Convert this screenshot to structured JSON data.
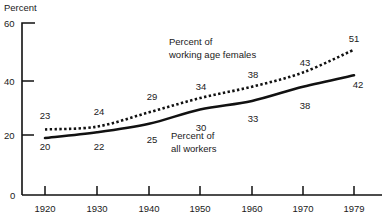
{
  "chart_data": {
    "type": "line",
    "title": "",
    "xlabel": "",
    "ylabel": "Percent",
    "ylim": [
      0,
      60
    ],
    "yticks": [
      0,
      20,
      40,
      60
    ],
    "grid": false,
    "legend_position": "inline-annotation",
    "categories": [
      "1920",
      "1930",
      "1940",
      "1950",
      "1960",
      "1970",
      "1979"
    ],
    "x": [
      1920,
      1930,
      1940,
      1950,
      1960,
      1970,
      1979
    ],
    "series": [
      {
        "name": "Percent of working age females",
        "style": "dotted",
        "values": [
          23,
          24,
          29,
          34,
          38,
          43,
          51
        ]
      },
      {
        "name": "Percent of all workers",
        "style": "solid",
        "values": [
          20,
          22,
          25,
          30,
          33,
          38,
          42
        ]
      }
    ]
  },
  "axis": {
    "y_unit_label": "Percent",
    "y_ticks": [
      "60",
      "40",
      "20",
      "0"
    ],
    "x_ticks": [
      "1920",
      "1930",
      "1940",
      "1950",
      "1960",
      "1970",
      "1979"
    ]
  },
  "annotations": {
    "females_line1": "Percent of",
    "females_line2": "working age females",
    "workers_line1": "Percent of",
    "workers_line2": "all workers"
  },
  "point_labels": {
    "females": [
      "23",
      "24",
      "29",
      "34",
      "38",
      "43",
      "51"
    ],
    "workers": [
      "20",
      "22",
      "25",
      "30",
      "33",
      "38",
      "42"
    ]
  },
  "cropped_header": "",
  "colors": {
    "ink": "#111111",
    "background": "#ffffff"
  }
}
